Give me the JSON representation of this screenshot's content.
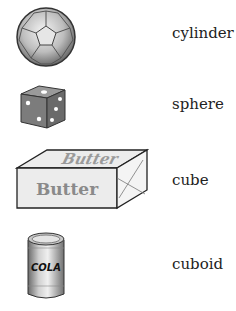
{
  "rows": [
    {
      "object": "soccer ball",
      "icon": "soccer-ball-icon",
      "label": "cylinder"
    },
    {
      "object": "dice",
      "icon": "dice-icon",
      "label": "sphere"
    },
    {
      "object": "butter box",
      "icon": "butter-box-icon",
      "label": "cube",
      "box_text": "Butter"
    },
    {
      "object": "cola can",
      "icon": "cola-can-icon",
      "label": "cuboid",
      "can_text": "COLA"
    }
  ]
}
